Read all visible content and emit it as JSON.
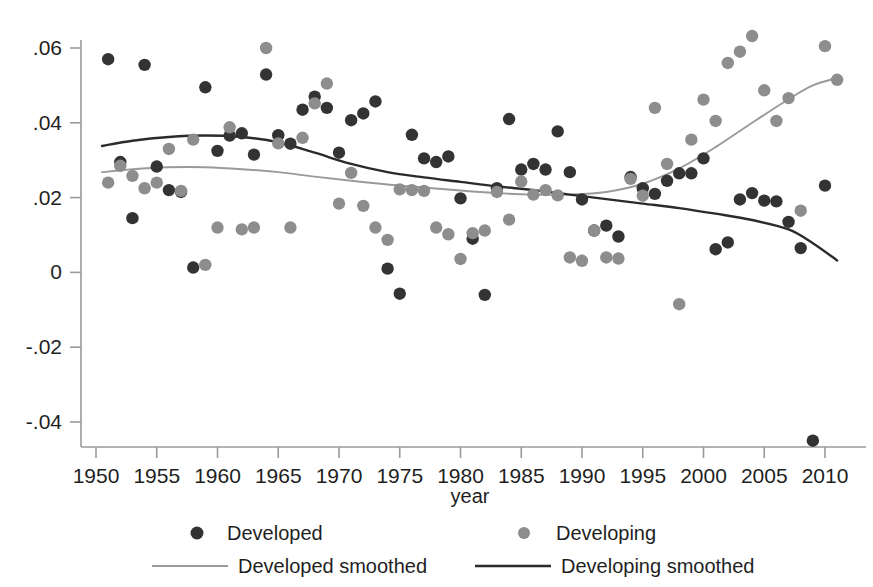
{
  "figure": {
    "title_partial": "",
    "background_color": "#ffffff"
  },
  "chart_data": {
    "type": "scatter",
    "title": "",
    "xlabel": "year",
    "ylabel": "",
    "xlim": [
      1949,
      2012
    ],
    "ylim": [
      -0.05,
      0.066
    ],
    "grid": false,
    "legend_position": "bottom",
    "xticks": [
      1950,
      1955,
      1960,
      1965,
      1970,
      1975,
      1980,
      1985,
      1990,
      1995,
      2000,
      2005,
      2010
    ],
    "xtick_labels": [
      "1950",
      "1955",
      "1960",
      "1965",
      "1970",
      "1975",
      "1980",
      "1985",
      "1990",
      "1995",
      "2000",
      "2005",
      "2010"
    ],
    "yticks": [
      0.06,
      0.04,
      0.02,
      0,
      -0.02,
      -0.04
    ],
    "ytick_labels": [
      ".06",
      ".04",
      ".02",
      "0",
      "-.02",
      "-.04"
    ],
    "colors": {
      "developed_points": "#333333",
      "developing_points": "#8d8d8d",
      "developed_smoothed_line": "#9a9a9a",
      "developing_smoothed_line": "#2b2b2b",
      "axis": "#9a9a9a"
    },
    "series": [
      {
        "name": "Developed",
        "marker": "circle",
        "color": "#333333",
        "points": [
          [
            1951,
            0.057
          ],
          [
            1952,
            0.0295
          ],
          [
            1953,
            0.0145
          ],
          [
            1954,
            0.0555
          ],
          [
            1955,
            0.0283
          ],
          [
            1956,
            0.022
          ],
          [
            1957,
            0.0215
          ],
          [
            1958,
            0.0013
          ],
          [
            1959,
            0.0495
          ],
          [
            1960,
            0.0325
          ],
          [
            1961,
            0.0366
          ],
          [
            1962,
            0.0372
          ],
          [
            1963,
            0.0315
          ],
          [
            1964,
            0.0529
          ],
          [
            1965,
            0.0367
          ],
          [
            1966,
            0.0344
          ],
          [
            1967,
            0.0435
          ],
          [
            1968,
            0.047
          ],
          [
            1969,
            0.044
          ],
          [
            1970,
            0.032
          ],
          [
            1971,
            0.0407
          ],
          [
            1972,
            0.0425
          ],
          [
            1973,
            0.0457
          ],
          [
            1974,
            0.001
          ],
          [
            1975,
            -0.0057
          ],
          [
            1976,
            0.0368
          ],
          [
            1977,
            0.0305
          ],
          [
            1978,
            0.0295
          ],
          [
            1979,
            0.031
          ],
          [
            1980,
            0.0198
          ],
          [
            1981,
            0.009
          ],
          [
            1982,
            -0.006
          ],
          [
            1983,
            0.0225
          ],
          [
            1984,
            0.041
          ],
          [
            1985,
            0.0275
          ],
          [
            1986,
            0.029
          ],
          [
            1987,
            0.0275
          ],
          [
            1988,
            0.0377
          ],
          [
            1989,
            0.0268
          ],
          [
            1990,
            0.0195
          ],
          [
            1991,
            0.0112
          ],
          [
            1992,
            0.0125
          ],
          [
            1993,
            0.0096
          ],
          [
            1994,
            0.0255
          ],
          [
            1995,
            0.0225
          ],
          [
            1996,
            0.021
          ],
          [
            1997,
            0.0245
          ],
          [
            1998,
            0.0265
          ],
          [
            1999,
            0.0265
          ],
          [
            2000,
            0.0305
          ],
          [
            2001,
            0.0062
          ],
          [
            2002,
            0.008
          ],
          [
            2003,
            0.0195
          ],
          [
            2004,
            0.0212
          ],
          [
            2005,
            0.0192
          ],
          [
            2006,
            0.019
          ],
          [
            2007,
            0.0135
          ],
          [
            2008,
            0.0065
          ],
          [
            2009,
            -0.045
          ],
          [
            2010,
            0.0232
          ]
        ]
      },
      {
        "name": "Developing",
        "marker": "circle",
        "color": "#8d8d8d",
        "points": [
          [
            1951,
            0.024
          ],
          [
            1952,
            0.0285
          ],
          [
            1953,
            0.0258
          ],
          [
            1954,
            0.0225
          ],
          [
            1955,
            0.024
          ],
          [
            1956,
            0.033
          ],
          [
            1957,
            0.0218
          ],
          [
            1958,
            0.0355
          ],
          [
            1959,
            0.002
          ],
          [
            1960,
            0.012
          ],
          [
            1961,
            0.0388
          ],
          [
            1962,
            0.0115
          ],
          [
            1963,
            0.012
          ],
          [
            1964,
            0.06
          ],
          [
            1965,
            0.0345
          ],
          [
            1966,
            0.012
          ],
          [
            1967,
            0.036
          ],
          [
            1968,
            0.0452
          ],
          [
            1969,
            0.0505
          ],
          [
            1970,
            0.0184
          ],
          [
            1971,
            0.0266
          ],
          [
            1972,
            0.0178
          ],
          [
            1973,
            0.012
          ],
          [
            1974,
            0.0087
          ],
          [
            1975,
            0.0222
          ],
          [
            1976,
            0.022
          ],
          [
            1977,
            0.0218
          ],
          [
            1978,
            0.012
          ],
          [
            1979,
            0.0102
          ],
          [
            1980,
            0.0036
          ],
          [
            1981,
            0.0105
          ],
          [
            1982,
            0.0112
          ],
          [
            1983,
            0.0215
          ],
          [
            1984,
            0.0141
          ],
          [
            1985,
            0.0243
          ],
          [
            1986,
            0.0208
          ],
          [
            1987,
            0.022
          ],
          [
            1988,
            0.0206
          ],
          [
            1989,
            0.004
          ],
          [
            1990,
            0.0031
          ],
          [
            1991,
            0.0112
          ],
          [
            1992,
            0.004
          ],
          [
            1993,
            0.0037
          ],
          [
            1994,
            0.025
          ],
          [
            1995,
            0.0205
          ],
          [
            1996,
            0.044
          ],
          [
            1997,
            0.029
          ],
          [
            1998,
            -0.0085
          ],
          [
            1999,
            0.0355
          ],
          [
            2000,
            0.0462
          ],
          [
            2001,
            0.0405
          ],
          [
            2002,
            0.056
          ],
          [
            2003,
            0.059
          ],
          [
            2004,
            0.0632
          ],
          [
            2005,
            0.0487
          ],
          [
            2006,
            0.0405
          ],
          [
            2007,
            0.0466
          ],
          [
            2008,
            0.0165
          ],
          [
            2010,
            0.0605
          ],
          [
            2011,
            0.0515
          ]
        ]
      }
    ],
    "lines": [
      {
        "name": "Developed smoothed",
        "color": "#9a9a9a",
        "points": [
          [
            1950.5,
            0.0268
          ],
          [
            1953,
            0.0276
          ],
          [
            1956,
            0.0281
          ],
          [
            1959,
            0.0281
          ],
          [
            1962,
            0.0276
          ],
          [
            1965,
            0.0268
          ],
          [
            1968,
            0.0256
          ],
          [
            1971,
            0.0245
          ],
          [
            1974,
            0.0235
          ],
          [
            1977,
            0.0227
          ],
          [
            1980,
            0.0219
          ],
          [
            1983,
            0.0212
          ],
          [
            1986,
            0.0208
          ],
          [
            1989,
            0.0208
          ],
          [
            1992,
            0.0215
          ],
          [
            1995,
            0.0237
          ],
          [
            1998,
            0.0278
          ],
          [
            2001,
            0.0335
          ],
          [
            2004,
            0.04
          ],
          [
            2007,
            0.0463
          ],
          [
            2009,
            0.05
          ],
          [
            2011,
            0.052
          ]
        ]
      },
      {
        "name": "Developing smoothed",
        "color": "#2b2b2b",
        "points": [
          [
            1950.5,
            0.0338
          ],
          [
            1953,
            0.0352
          ],
          [
            1956,
            0.0362
          ],
          [
            1959,
            0.0366
          ],
          [
            1962,
            0.0362
          ],
          [
            1965,
            0.0348
          ],
          [
            1968,
            0.032
          ],
          [
            1971,
            0.029
          ],
          [
            1974,
            0.0268
          ],
          [
            1977,
            0.0254
          ],
          [
            1980,
            0.0242
          ],
          [
            1983,
            0.023
          ],
          [
            1986,
            0.022
          ],
          [
            1989,
            0.0208
          ],
          [
            1992,
            0.0196
          ],
          [
            1995,
            0.0184
          ],
          [
            1998,
            0.0172
          ],
          [
            2001,
            0.0157
          ],
          [
            2004,
            0.014
          ],
          [
            2007,
            0.0115
          ],
          [
            2009,
            0.0078
          ],
          [
            2011,
            0.0032
          ]
        ]
      }
    ]
  },
  "legend": {
    "entries": [
      {
        "label": "Developed",
        "type": "marker",
        "color": "#333333"
      },
      {
        "label": "Developing",
        "type": "marker",
        "color": "#8d8d8d"
      },
      {
        "label": "Developed smoothed",
        "type": "line",
        "color": "#9a9a9a"
      },
      {
        "label": "Developing smoothed",
        "type": "line",
        "color": "#2b2b2b"
      }
    ]
  }
}
